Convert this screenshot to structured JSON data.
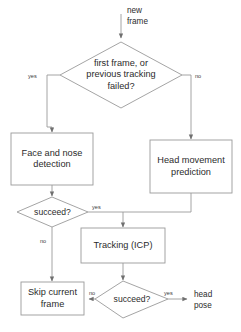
{
  "diagram": {
    "type": "flowchart",
    "canvas": {
      "width": 241,
      "height": 332
    },
    "stroke_color": "#808080",
    "text_color": "#2b2b2b",
    "background": "#ffffff"
  },
  "terminals": {
    "input": "new\nframe",
    "output": "head\npose"
  },
  "nodes": {
    "decision_first_frame": "first frame, or\nprevious tracking\nfailed?",
    "process_face_detection": "Face and nose\ndetection",
    "process_head_prediction": "Head movement\nprediction",
    "decision_detect_succeed": "succeed?",
    "process_tracking": "Tracking (ICP)",
    "decision_track_succeed": "succeed?",
    "process_skip_frame": "Skip current\nframe"
  },
  "edge_labels": {
    "first_frame_yes": "yes",
    "first_frame_no": "no",
    "detect_succeed_yes": "yes",
    "detect_succeed_no": "no",
    "track_succeed_yes": "yes",
    "track_succeed_no": "no"
  }
}
